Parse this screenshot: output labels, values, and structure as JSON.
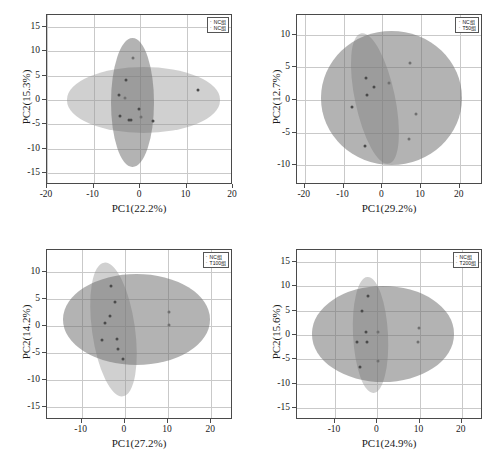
{
  "figure": {
    "panel_count": 4,
    "marker_series_a": "·",
    "marker_series_b": "·"
  },
  "chart_data": [
    {
      "type": "scatter",
      "panel": "top-left",
      "title": "",
      "xlabel": "PC1(22.2%)",
      "ylabel": "PC2(15.3%)",
      "xlim": [
        -20,
        20
      ],
      "ylim": [
        -17.5,
        17.5
      ],
      "xticks": [
        -20,
        -10,
        0,
        10,
        20
      ],
      "yticks": [
        15,
        10,
        5,
        0,
        -5,
        -10,
        -15
      ],
      "xticklabels": [
        "-20",
        "-10",
        "0",
        "10",
        "20"
      ],
      "yticklabels": [
        "15",
        "10",
        "5",
        "0",
        "-5",
        "-10",
        "-15"
      ],
      "grid": true,
      "legend_position": "top-right",
      "series": [
        {
          "name": "NC组",
          "color": "#4a4a4a",
          "ellipse": {
            "cx": 0.7,
            "cy": 0.0,
            "rx": 16.5,
            "ry": 6.7,
            "angle": 0
          },
          "points": [
            {
              "x": -3.0,
              "y": 4.2
            },
            {
              "x": -4.6,
              "y": 1.0
            },
            {
              "x": -4.2,
              "y": -3.2
            },
            {
              "x": -2.3,
              "y": -4.1
            },
            {
              "x": -1.9,
              "y": -4.2
            },
            {
              "x": -0.3,
              "y": -1.9
            },
            {
              "x": 2.9,
              "y": -4.4
            },
            {
              "x": 12.4,
              "y": 2.1
            }
          ]
        },
        {
          "name": "NC组",
          "color": "#707070",
          "ellipse": {
            "cx": -1.6,
            "cy": -0.5,
            "rx": 4.6,
            "ry": 13.3,
            "angle": 0
          },
          "points": [
            {
              "x": -1.4,
              "y": 8.7
            },
            {
              "x": -3.2,
              "y": 0.4
            },
            {
              "x": 0.2,
              "y": -3.4
            }
          ]
        }
      ]
    },
    {
      "type": "scatter",
      "panel": "top-right",
      "title": "",
      "xlabel": "PC1(29.2%)",
      "ylabel": "PC2(12.7%)",
      "xlim": [
        -22,
        26
      ],
      "ylim": [
        -13,
        13
      ],
      "xticks": [
        -20,
        -10,
        0,
        10,
        20
      ],
      "yticks": [
        10,
        5,
        0,
        -5,
        -10
      ],
      "xticklabels": [
        "-20",
        "-10",
        "0",
        "10",
        "20"
      ],
      "yticklabels": [
        "10",
        "5",
        "0",
        "-5",
        "-10"
      ],
      "grid": true,
      "legend_position": "top-right",
      "series": [
        {
          "name": "NC组",
          "color": "#4a4a4a",
          "ellipse": {
            "cx": -2.0,
            "cy": 0.2,
            "rx": 5.1,
            "ry": 10.2,
            "angle": -12
          },
          "points": [
            {
              "x": -4.2,
              "y": 3.3
            },
            {
              "x": -2.2,
              "y": 2.0
            },
            {
              "x": -4.0,
              "y": 0.8
            },
            {
              "x": -7.9,
              "y": -1.1
            },
            {
              "x": -4.5,
              "y": -7.0
            }
          ]
        },
        {
          "name": "T50组",
          "color": "#707070",
          "ellipse": {
            "cx": 2.5,
            "cy": 0.3,
            "rx": 18.2,
            "ry": 10.2,
            "angle": 0
          },
          "points": [
            {
              "x": 7.1,
              "y": 5.6
            },
            {
              "x": 1.8,
              "y": 2.6
            },
            {
              "x": 8.6,
              "y": -2.2
            },
            {
              "x": 6.8,
              "y": -5.9
            }
          ]
        }
      ]
    },
    {
      "type": "scatter",
      "panel": "bottom-left",
      "title": "",
      "xlabel": "PC1(27.2%)",
      "ylabel": "PC2(14.2%)",
      "xlim": [
        -18,
        25
      ],
      "ylim": [
        -17.5,
        14
      ],
      "xticks": [
        -10,
        0,
        10,
        20
      ],
      "yticks": [
        10,
        5,
        0,
        -5,
        -10,
        -15
      ],
      "xticklabels": [
        "-10",
        "0",
        "10",
        "20"
      ],
      "yticklabels": [
        "10",
        "5",
        "0",
        "-5",
        "-10",
        "-15"
      ],
      "grid": true,
      "legend_position": "top-right",
      "series": [
        {
          "name": "NC组",
          "color": "#4a4a4a",
          "ellipse": {
            "cx": -2.6,
            "cy": -0.8,
            "rx": 5.0,
            "ry": 12.5,
            "angle": -8
          },
          "points": [
            {
              "x": -3.1,
              "y": 7.4
            },
            {
              "x": -2.3,
              "y": 4.3
            },
            {
              "x": -3.4,
              "y": 1.7
            },
            {
              "x": -4.5,
              "y": 0.5
            },
            {
              "x": -5.3,
              "y": -2.6
            },
            {
              "x": -1.9,
              "y": -2.4
            },
            {
              "x": -1.5,
              "y": -4.4
            },
            {
              "x": -0.4,
              "y": -6.2
            }
          ]
        },
        {
          "name": "T100组",
          "color": "#707070",
          "ellipse": {
            "cx": 2.8,
            "cy": 1.1,
            "rx": 17.0,
            "ry": 8.4,
            "angle": 0
          },
          "points": [
            {
              "x": 10.3,
              "y": 2.5
            },
            {
              "x": 10.2,
              "y": 0.1
            }
          ]
        }
      ]
    },
    {
      "type": "scatter",
      "panel": "bottom-right",
      "title": "",
      "xlabel": "PC1(24.9%)",
      "ylabel": "PC2(15.6%)",
      "xlim": [
        -19,
        25
      ],
      "ylim": [
        -17.5,
        17.5
      ],
      "xticks": [
        -10,
        0,
        10,
        20
      ],
      "yticks": [
        15,
        10,
        5,
        0,
        -5,
        -10,
        -15
      ],
      "xticklabels": [
        "-10",
        "0",
        "10",
        "20"
      ],
      "yticklabels": [
        "15",
        "10",
        "5",
        "0",
        "-5",
        "-10",
        "-15"
      ],
      "grid": true,
      "legend_position": "top-right",
      "series": [
        {
          "name": "NC组",
          "color": "#4a4a4a",
          "ellipse": {
            "cx": -1.7,
            "cy": 0.0,
            "rx": 4.1,
            "ry": 11.9,
            "angle": -3
          },
          "points": [
            {
              "x": -2.2,
              "y": 8.0
            },
            {
              "x": -3.6,
              "y": 4.9
            },
            {
              "x": -2.6,
              "y": 0.7
            },
            {
              "x": -4.7,
              "y": -1.5
            },
            {
              "x": -2.5,
              "y": -1.5
            },
            {
              "x": -4.0,
              "y": -6.5
            }
          ]
        },
        {
          "name": "T200组",
          "color": "#707070",
          "ellipse": {
            "cx": 1.4,
            "cy": 0.2,
            "rx": 16.8,
            "ry": 9.8,
            "angle": 0
          },
          "points": [
            {
              "x": 0.2,
              "y": 0.6
            },
            {
              "x": 9.8,
              "y": 1.5
            },
            {
              "x": 9.7,
              "y": -1.5
            },
            {
              "x": 0.1,
              "y": -5.4
            }
          ]
        }
      ]
    }
  ]
}
